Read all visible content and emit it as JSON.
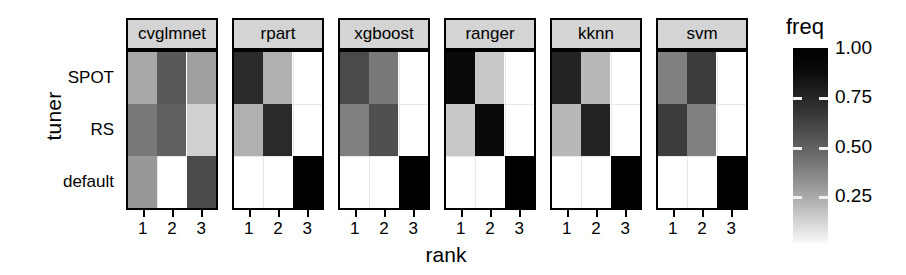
{
  "axes": {
    "ylabel": "tuner",
    "xlabel": "rank",
    "ycategories": [
      "SPOT",
      "RS",
      "default"
    ],
    "xcategories": [
      "1",
      "2",
      "3"
    ]
  },
  "legend": {
    "title": "freq",
    "ticks": [
      "1.00",
      "0.75",
      "0.50",
      "0.25"
    ],
    "tick_values": [
      1.0,
      0.75,
      0.5,
      0.25
    ],
    "low_color": "#ffffff",
    "high_color": "#000000",
    "orientation": "vertical"
  },
  "chart_data": {
    "type": "heatmap",
    "title": "",
    "xlabel": "rank",
    "ylabel": "tuner",
    "x": [
      "1",
      "2",
      "3"
    ],
    "y": [
      "SPOT",
      "RS",
      "default"
    ],
    "value_label": "freq",
    "zlim": [
      0,
      1
    ],
    "grid": true,
    "legend_position": "right",
    "colormap": "grayscale_reversed",
    "facet_variable": "learner",
    "facets": [
      {
        "label": "cvglmnet",
        "cells": [
          {
            "y": "SPOT",
            "x": "1",
            "value": 0.4,
            "color": "#a8a8a8"
          },
          {
            "y": "SPOT",
            "x": "2",
            "value": 0.63,
            "color": "#585858"
          },
          {
            "y": "SPOT",
            "x": "3",
            "value": 0.42,
            "color": "#a0a0a0"
          },
          {
            "y": "RS",
            "x": "1",
            "value": 0.52,
            "color": "#787878"
          },
          {
            "y": "RS",
            "x": "2",
            "value": 0.6,
            "color": "#606060"
          },
          {
            "y": "RS",
            "x": "3",
            "value": 0.22,
            "color": "#d0d0d0"
          },
          {
            "y": "default",
            "x": "1",
            "value": 0.44,
            "color": "#989898"
          },
          {
            "y": "default",
            "x": "2",
            "value": 0.0,
            "color": "#ffffff"
          },
          {
            "y": "default",
            "x": "3",
            "value": 0.68,
            "color": "#4a4a4a"
          }
        ]
      },
      {
        "label": "rpart",
        "cells": [
          {
            "y": "SPOT",
            "x": "1",
            "value": 0.84,
            "color": "#2a2a2a"
          },
          {
            "y": "SPOT",
            "x": "2",
            "value": 0.36,
            "color": "#b0b0b0"
          },
          {
            "y": "SPOT",
            "x": "3",
            "value": 0.0,
            "color": "#ffffff"
          },
          {
            "y": "RS",
            "x": "1",
            "value": 0.36,
            "color": "#b0b0b0"
          },
          {
            "y": "RS",
            "x": "2",
            "value": 0.84,
            "color": "#2a2a2a"
          },
          {
            "y": "RS",
            "x": "3",
            "value": 0.0,
            "color": "#ffffff"
          },
          {
            "y": "default",
            "x": "1",
            "value": 0.0,
            "color": "#ffffff"
          },
          {
            "y": "default",
            "x": "2",
            "value": 0.0,
            "color": "#ffffff"
          },
          {
            "y": "default",
            "x": "3",
            "value": 1.0,
            "color": "#000000"
          }
        ]
      },
      {
        "label": "xgboost",
        "cells": [
          {
            "y": "SPOT",
            "x": "1",
            "value": 0.68,
            "color": "#4a4a4a"
          },
          {
            "y": "SPOT",
            "x": "2",
            "value": 0.52,
            "color": "#787878"
          },
          {
            "y": "SPOT",
            "x": "3",
            "value": 0.0,
            "color": "#ffffff"
          },
          {
            "y": "RS",
            "x": "1",
            "value": 0.5,
            "color": "#808080"
          },
          {
            "y": "RS",
            "x": "2",
            "value": 0.66,
            "color": "#505050"
          },
          {
            "y": "RS",
            "x": "3",
            "value": 0.0,
            "color": "#ffffff"
          },
          {
            "y": "default",
            "x": "1",
            "value": 0.0,
            "color": "#ffffff"
          },
          {
            "y": "default",
            "x": "2",
            "value": 0.0,
            "color": "#ffffff"
          },
          {
            "y": "default",
            "x": "3",
            "value": 1.0,
            "color": "#000000"
          }
        ]
      },
      {
        "label": "ranger",
        "cells": [
          {
            "y": "SPOT",
            "x": "1",
            "value": 0.96,
            "color": "#0a0a0a"
          },
          {
            "y": "SPOT",
            "x": "2",
            "value": 0.26,
            "color": "#c8c8c8"
          },
          {
            "y": "SPOT",
            "x": "3",
            "value": 0.0,
            "color": "#ffffff"
          },
          {
            "y": "RS",
            "x": "1",
            "value": 0.26,
            "color": "#c8c8c8"
          },
          {
            "y": "RS",
            "x": "2",
            "value": 0.96,
            "color": "#0a0a0a"
          },
          {
            "y": "RS",
            "x": "3",
            "value": 0.0,
            "color": "#ffffff"
          },
          {
            "y": "default",
            "x": "1",
            "value": 0.0,
            "color": "#ffffff"
          },
          {
            "y": "default",
            "x": "2",
            "value": 0.0,
            "color": "#ffffff"
          },
          {
            "y": "default",
            "x": "3",
            "value": 1.0,
            "color": "#000000"
          }
        ]
      },
      {
        "label": "kknn",
        "cells": [
          {
            "y": "SPOT",
            "x": "1",
            "value": 0.88,
            "color": "#232323"
          },
          {
            "y": "SPOT",
            "x": "2",
            "value": 0.33,
            "color": "#b8b8b8"
          },
          {
            "y": "SPOT",
            "x": "3",
            "value": 0.0,
            "color": "#ffffff"
          },
          {
            "y": "RS",
            "x": "1",
            "value": 0.33,
            "color": "#b8b8b8"
          },
          {
            "y": "RS",
            "x": "2",
            "value": 0.88,
            "color": "#232323"
          },
          {
            "y": "RS",
            "x": "3",
            "value": 0.0,
            "color": "#ffffff"
          },
          {
            "y": "default",
            "x": "1",
            "value": 0.0,
            "color": "#ffffff"
          },
          {
            "y": "default",
            "x": "2",
            "value": 0.0,
            "color": "#ffffff"
          },
          {
            "y": "default",
            "x": "3",
            "value": 1.0,
            "color": "#000000"
          }
        ]
      },
      {
        "label": "svm",
        "cells": [
          {
            "y": "SPOT",
            "x": "1",
            "value": 0.5,
            "color": "#808080"
          },
          {
            "y": "SPOT",
            "x": "2",
            "value": 0.74,
            "color": "#3c3c3c"
          },
          {
            "y": "SPOT",
            "x": "3",
            "value": 0.0,
            "color": "#ffffff"
          },
          {
            "y": "RS",
            "x": "1",
            "value": 0.74,
            "color": "#3c3c3c"
          },
          {
            "y": "RS",
            "x": "2",
            "value": 0.5,
            "color": "#808080"
          },
          {
            "y": "RS",
            "x": "3",
            "value": 0.0,
            "color": "#ffffff"
          },
          {
            "y": "default",
            "x": "1",
            "value": 0.0,
            "color": "#ffffff"
          },
          {
            "y": "default",
            "x": "2",
            "value": 0.0,
            "color": "#ffffff"
          },
          {
            "y": "default",
            "x": "3",
            "value": 1.0,
            "color": "#000000"
          }
        ]
      }
    ]
  }
}
